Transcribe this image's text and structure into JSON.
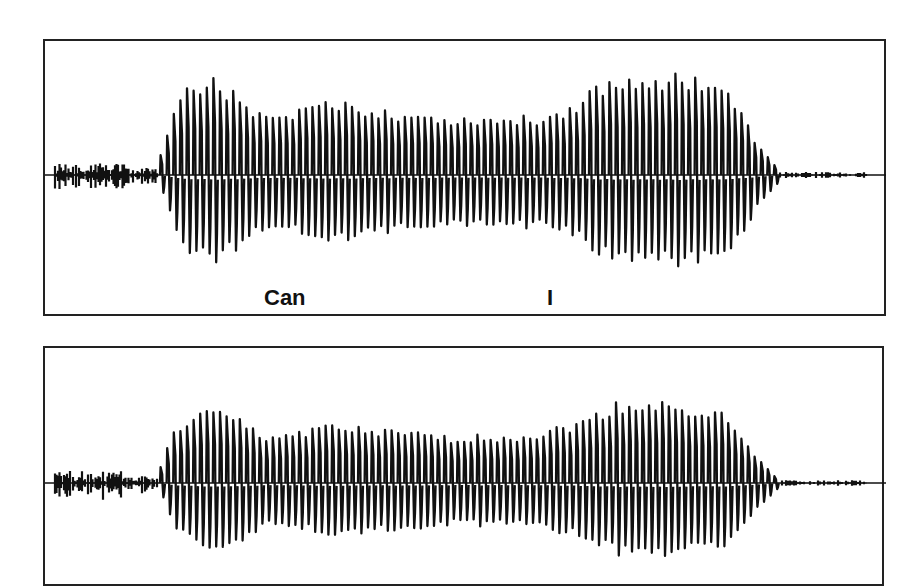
{
  "figure": {
    "panels": [
      {
        "id": "top",
        "labels": [
          {
            "text": "Can",
            "x_px": 263
          },
          {
            "text": "I",
            "x_px": 549
          }
        ],
        "baseline_y": 175,
        "noise_start_x": 55,
        "noise_end_x": 158,
        "voiced_start_x": 160,
        "voiced_end_x": 770,
        "tail_end_x": 868,
        "envelope": [
          [
            160,
            20
          ],
          [
            170,
            55
          ],
          [
            180,
            80
          ],
          [
            210,
            95
          ],
          [
            240,
            75
          ],
          [
            265,
            55
          ],
          [
            290,
            55
          ],
          [
            310,
            68
          ],
          [
            350,
            68
          ],
          [
            400,
            60
          ],
          [
            450,
            55
          ],
          [
            500,
            55
          ],
          [
            540,
            55
          ],
          [
            560,
            62
          ],
          [
            580,
            72
          ],
          [
            600,
            88
          ],
          [
            640,
            95
          ],
          [
            690,
            95
          ],
          [
            720,
            88
          ],
          [
            740,
            60
          ],
          [
            760,
            25
          ],
          [
            775,
            8
          ]
        ]
      },
      {
        "id": "bottom",
        "labels": [],
        "baseline_y": 483,
        "noise_start_x": 55,
        "noise_end_x": 158,
        "voiced_start_x": 160,
        "voiced_end_x": 770,
        "tail_end_x": 868,
        "envelope": [
          [
            160,
            15
          ],
          [
            170,
            45
          ],
          [
            185,
            60
          ],
          [
            210,
            70
          ],
          [
            240,
            60
          ],
          [
            265,
            45
          ],
          [
            290,
            48
          ],
          [
            320,
            55
          ],
          [
            360,
            52
          ],
          [
            400,
            48
          ],
          [
            450,
            45
          ],
          [
            500,
            45
          ],
          [
            540,
            48
          ],
          [
            565,
            55
          ],
          [
            590,
            62
          ],
          [
            610,
            75
          ],
          [
            640,
            78
          ],
          [
            690,
            75
          ],
          [
            720,
            68
          ],
          [
            740,
            45
          ],
          [
            760,
            20
          ],
          [
            775,
            6
          ]
        ]
      }
    ],
    "chart_data": {
      "type": "line",
      "title": "",
      "xlabel": "",
      "ylabel": "",
      "series": [
        {
          "name": "waveform top (\"Can I\")",
          "annotations": [
            "Can",
            "I"
          ]
        },
        {
          "name": "waveform bottom",
          "annotations": []
        }
      ]
    }
  }
}
